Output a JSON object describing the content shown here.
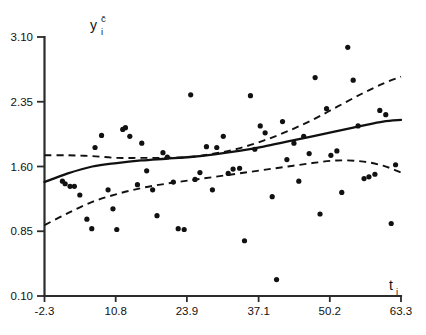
{
  "chart_data": {
    "type": "scatter",
    "title": "",
    "subtitle": "",
    "xlabel": "t_i",
    "ylabel": "y_i^c",
    "xlabel_base": "t",
    "xlabel_sub": "i",
    "ylabel_base": "y",
    "ylabel_sub": "i",
    "ylabel_sup": "c̄",
    "xlim": [
      -2.3,
      63.3
    ],
    "ylim": [
      0.1,
      3.1
    ],
    "xticks": [
      -2.3,
      10.8,
      23.9,
      37.1,
      50.2,
      63.3
    ],
    "xticklabels": [
      "-2.3",
      "10.8",
      "23.9",
      "37.1",
      "50.2",
      "63.3"
    ],
    "yticks": [
      0.1,
      0.85,
      1.6,
      2.35,
      3.1
    ],
    "yticklabels": [
      "0.10",
      "0.85",
      "1.60",
      "2.35",
      "3.10"
    ],
    "grid": false,
    "legend": false,
    "marker_color": "#111111",
    "line_color": "#111111",
    "axis_color": "#2b2b2b",
    "background": "#ffffff",
    "x": [
      1.0,
      1.5,
      2.4,
      3.2,
      4.2,
      5.5,
      6.4,
      7.0,
      8.2,
      9.4,
      10.3,
      11.0,
      12.1,
      12.6,
      13.4,
      14.8,
      15.6,
      16.5,
      17.6,
      18.4,
      19.5,
      20.3,
      21.4,
      22.3,
      23.4,
      24.6,
      25.4,
      26.3,
      27.5,
      28.6,
      29.4,
      30.6,
      31.5,
      32.4,
      33.6,
      34.5,
      35.6,
      36.4,
      37.4,
      38.3,
      39.6,
      40.4,
      41.5,
      42.3,
      43.6,
      44.5,
      45.4,
      46.4,
      47.5,
      48.4,
      49.6,
      50.4,
      51.5,
      52.4,
      53.5,
      54.5,
      55.4,
      56.5,
      57.4,
      58.5,
      59.4,
      60.5,
      61.5,
      62.3
    ],
    "y": [
      1.43,
      1.4,
      1.37,
      1.37,
      1.27,
      0.99,
      0.88,
      1.82,
      1.96,
      1.33,
      1.11,
      0.87,
      2.03,
      2.05,
      1.95,
      1.39,
      1.87,
      1.55,
      1.33,
      1.03,
      1.76,
      1.71,
      1.42,
      0.88,
      0.87,
      2.43,
      1.45,
      1.53,
      1.83,
      1.33,
      1.82,
      1.95,
      1.52,
      1.57,
      1.58,
      0.74,
      2.42,
      1.8,
      2.07,
      1.99,
      1.25,
      0.29,
      2.12,
      1.68,
      1.87,
      1.43,
      1.95,
      1.75,
      2.63,
      1.05,
      2.27,
      1.73,
      1.78,
      1.3,
      2.98,
      2.6,
      2.07,
      1.46,
      1.48,
      1.51,
      2.25,
      2.2,
      0.94,
      1.62
    ],
    "series": [
      {
        "name": "fitted-curve",
        "style": "solid",
        "x": [
          -2.3,
          2.0,
          6.5,
          11.0,
          15.5,
          20.0,
          24.5,
          29.0,
          33.5,
          38.0,
          42.5,
          47.0,
          51.5,
          56.0,
          60.0,
          63.3
        ],
        "y": [
          1.42,
          1.52,
          1.6,
          1.64,
          1.67,
          1.69,
          1.71,
          1.74,
          1.78,
          1.83,
          1.89,
          1.95,
          2.01,
          2.07,
          2.12,
          2.14
        ]
      },
      {
        "name": "upper-confidence-band",
        "style": "dashed",
        "x": [
          -2.3,
          2.0,
          6.5,
          11.0,
          15.5,
          20.0,
          24.5,
          29.0,
          33.5,
          38.0,
          42.5,
          47.0,
          51.5,
          56.0,
          60.0,
          63.3
        ],
        "y": [
          1.73,
          1.73,
          1.72,
          1.7,
          1.7,
          1.7,
          1.71,
          1.75,
          1.81,
          1.9,
          2.01,
          2.14,
          2.29,
          2.44,
          2.56,
          2.64
        ]
      },
      {
        "name": "lower-confidence-band",
        "style": "dashed",
        "x": [
          -2.3,
          2.0,
          6.5,
          11.0,
          15.5,
          20.0,
          24.5,
          29.0,
          33.5,
          38.0,
          42.5,
          47.0,
          51.5,
          56.0,
          60.0,
          63.3
        ],
        "y": [
          0.92,
          1.06,
          1.19,
          1.28,
          1.35,
          1.4,
          1.44,
          1.48,
          1.52,
          1.56,
          1.6,
          1.64,
          1.67,
          1.66,
          1.61,
          1.53
        ]
      }
    ]
  }
}
